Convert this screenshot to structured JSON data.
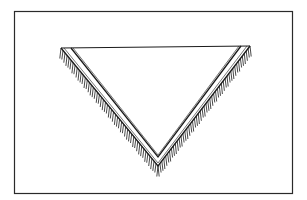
{
  "illustration": {
    "subject": "triangular fringed shawl",
    "description": "Line drawing of an inverted triangular shawl with a double-line border and fringe along the two lower edges, inside a rectangular frame",
    "colors": {
      "background": "#ffffff",
      "ink": "#1a1a1a",
      "frame": "#2a2a2a"
    },
    "frame": {
      "x": 14,
      "y": 11,
      "width": 278,
      "height": 182
    },
    "shawl": {
      "outer": {
        "left": [
          61,
          48
        ],
        "right": [
          250,
          46
        ],
        "apex": [
          158,
          166
        ]
      },
      "inner": {
        "left": [
          71,
          48
        ],
        "right": [
          241,
          46
        ],
        "apex": [
          158,
          157
        ]
      },
      "fringe_length": 9
    }
  }
}
